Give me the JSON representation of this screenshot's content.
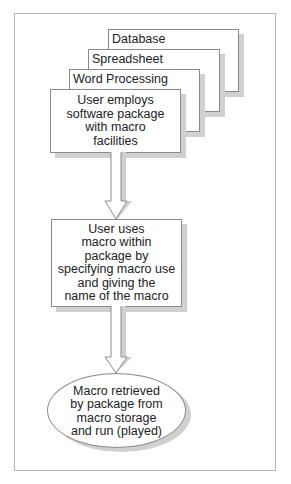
{
  "diagram": {
    "stack_cards": [
      {
        "label": "Database"
      },
      {
        "label": "Spreadsheet"
      },
      {
        "label": "Word Processing"
      }
    ],
    "steps": [
      {
        "shape": "rectangle",
        "lines": [
          "User employs",
          "software package",
          "with macro",
          "facilities"
        ]
      },
      {
        "shape": "rectangle",
        "lines": [
          "User uses",
          "macro within",
          "package by",
          "specifying macro use",
          "and giving the",
          "name of the macro"
        ]
      },
      {
        "shape": "ellipse",
        "lines": [
          "Macro retrieved",
          "by package from",
          "macro storage",
          "and run (played)"
        ]
      }
    ],
    "connectors": [
      {
        "from": 0,
        "to": 1,
        "type": "hollow-arrow"
      },
      {
        "from": 1,
        "to": 2,
        "type": "hollow-arrow"
      }
    ],
    "colors": {
      "border": "#8a8a8a",
      "shadow": "#d0d0d0",
      "frame": "#b8b8b8",
      "fill": "#ffffff",
      "text": "#222222"
    }
  }
}
